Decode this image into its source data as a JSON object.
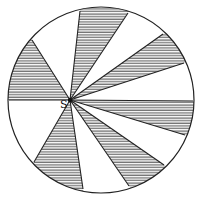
{
  "diagram": {
    "title": "",
    "circle": {
      "cx": 101,
      "cy": 100,
      "r": 93
    },
    "point": {
      "label": "S",
      "x": 70,
      "y": 100
    },
    "rays": [
      {
        "x": 80,
        "y": 11
      },
      {
        "x": 128,
        "y": 13
      },
      {
        "x": 163,
        "y": 34
      },
      {
        "x": 184,
        "y": 63
      },
      {
        "x": 193,
        "y": 101
      },
      {
        "x": 185,
        "y": 135
      },
      {
        "x": 164,
        "y": 165
      },
      {
        "x": 129,
        "y": 186
      },
      {
        "x": 83,
        "y": 189
      },
      {
        "x": 34,
        "y": 162
      },
      {
        "x": 9,
        "y": 100
      },
      {
        "x": 32,
        "y": 40
      }
    ],
    "shaded_sectors": [
      [
        0,
        1
      ],
      [
        2,
        3
      ],
      [
        4,
        5
      ],
      [
        6,
        7
      ],
      [
        8,
        9
      ],
      [
        10,
        11
      ]
    ],
    "colors": {
      "line": "#222222",
      "hatch": "#333333",
      "background": "#ffffff"
    }
  }
}
